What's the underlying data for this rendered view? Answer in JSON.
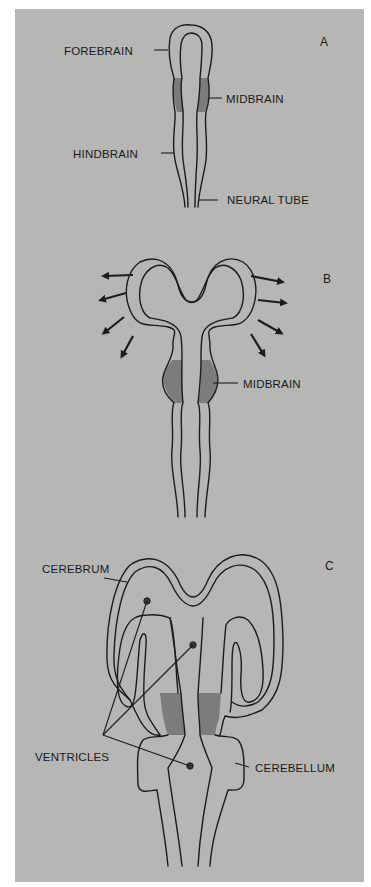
{
  "figure": {
    "colors": {
      "background": "#b6b6b4",
      "shading": "#7c7c7a",
      "line": "#1c1c1c"
    },
    "panels": [
      {
        "id": "A",
        "letter": "A",
        "labels": {
          "forebrain": "FOREBRAIN",
          "midbrain": "MIDBRAIN",
          "hindbrain": "HINDBRAIN",
          "neural_tube": "NEURAL TUBE"
        }
      },
      {
        "id": "B",
        "letter": "B",
        "labels": {
          "midbrain": "MIDBRAIN"
        },
        "arrows_left": 4,
        "arrows_right": 4
      },
      {
        "id": "C",
        "letter": "C",
        "labels": {
          "cerebrum": "CEREBRUM",
          "ventricles": "VENTRICLES",
          "cerebellum": "CEREBELLUM"
        },
        "ventricle_markers": 3
      }
    ]
  }
}
